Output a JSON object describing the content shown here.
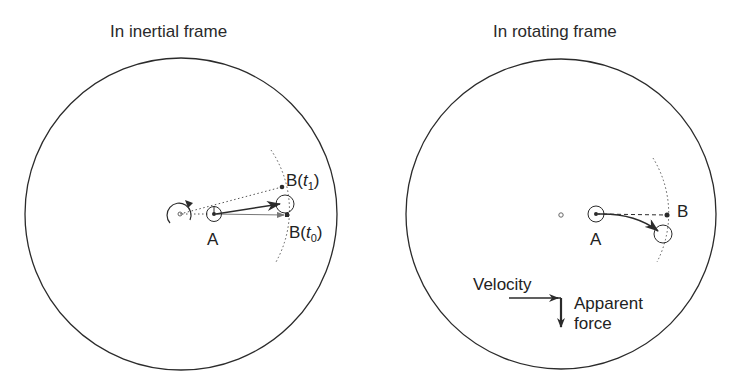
{
  "panels": [
    {
      "title": "In inertial frame",
      "labels": {
        "a": "A",
        "b_t1_main": "B(",
        "b_t1_var": "t",
        "b_t1_sub": "1",
        "b_t1_close": ")",
        "b_t0_main": "B(",
        "b_t0_var": "t",
        "b_t0_sub": "0",
        "b_t0_close": ")"
      }
    },
    {
      "title": "In rotating frame",
      "labels": {
        "a": "A",
        "b": "B",
        "velocity": "Velocity",
        "apparent": "Apparent",
        "force": "force"
      }
    }
  ],
  "colors": {
    "stroke": "#2b2b2b",
    "dotted": "#555555",
    "background": "#ffffff"
  }
}
